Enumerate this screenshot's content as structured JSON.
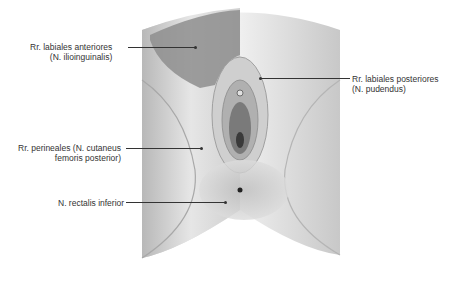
{
  "figure": {
    "colors": {
      "skin_light": "#ededed",
      "skin_mid": "#d4d4d4",
      "skin_shadow": "#9a9a9a",
      "region_dark": "#8c8c8c",
      "region_overlay": "#b5b5b5",
      "label_text": "#333333"
    }
  },
  "labels": [
    {
      "id": "rr-labiales-anteriores",
      "line1": "Rr. labiales anteriores",
      "line2": "(N. ilioinguinalis)"
    },
    {
      "id": "rr-labiales-posteriores",
      "line1": "Rr. labiales posteriores",
      "line2": "(N. pudendus)"
    },
    {
      "id": "rr-perineales",
      "line1": "Rr. perineales (N. cutaneus",
      "line2": "femoris posterior)"
    },
    {
      "id": "n-rectalis-inferior",
      "line1": "N. rectalis inferior"
    }
  ]
}
